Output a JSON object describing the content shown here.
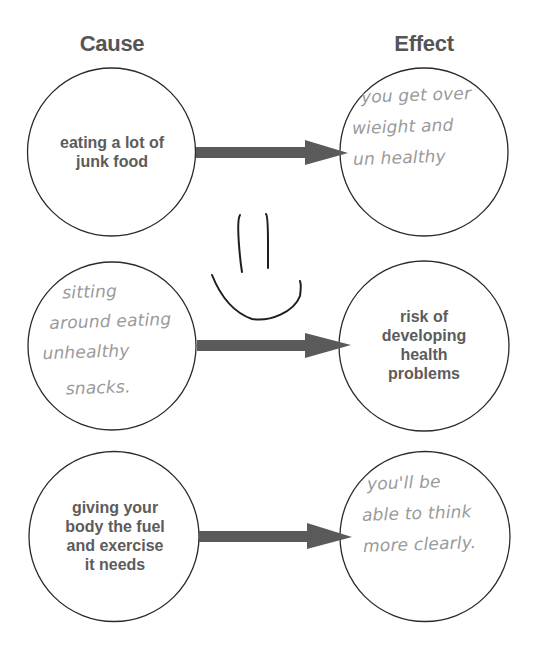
{
  "headers": {
    "cause": "Cause",
    "effect": "Effect"
  },
  "rows": [
    {
      "cause": {
        "type": "printed",
        "lines": [
          "eating a lot of",
          "junk food"
        ]
      },
      "effect": {
        "type": "handwritten",
        "lines": [
          "you get over",
          "wieight and",
          "un healthy"
        ]
      }
    },
    {
      "cause": {
        "type": "handwritten",
        "lines": [
          "sitting",
          "around eating",
          "unhealthy",
          "snacks."
        ]
      },
      "effect": {
        "type": "printed",
        "lines": [
          "risk of",
          "developing",
          "health",
          "problems"
        ]
      }
    },
    {
      "cause": {
        "type": "printed",
        "lines": [
          "giving your",
          "body the fuel",
          "and exercise",
          "it needs"
        ]
      },
      "effect": {
        "type": "handwritten",
        "lines": [
          "you'll be",
          "able to think",
          "more clearly."
        ]
      }
    }
  ],
  "doodle": {
    "icon": "smiley-face-icon"
  },
  "colors": {
    "printed_text": "#5c5c5c",
    "handwriting": "#9a9a9a",
    "arrow": "#5a5a5a",
    "circle_stroke": "#2a2a2a",
    "doodle_stroke": "#1e1e1e",
    "background": "#ffffff"
  }
}
